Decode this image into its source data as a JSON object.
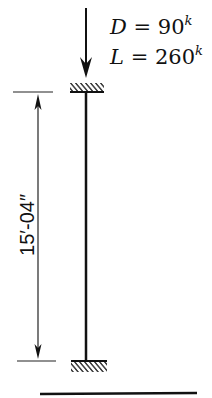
{
  "diagram": {
    "type": "column-axial-load",
    "loads": {
      "dead": {
        "symbol": "D",
        "equals": "=",
        "value": "90",
        "unit": "k"
      },
      "live": {
        "symbol": "L",
        "equals": "=",
        "value": "260",
        "unit": "k"
      }
    },
    "dimension": {
      "label": "15′-04″"
    },
    "supports": {
      "top": "fixed",
      "bottom": "fixed"
    },
    "colors": {
      "line": "#111111",
      "background": "#ffffff"
    }
  }
}
